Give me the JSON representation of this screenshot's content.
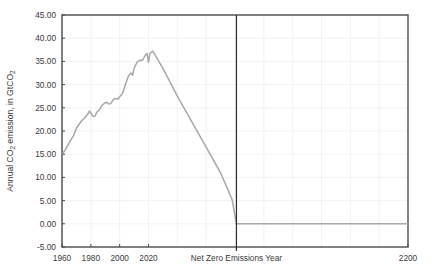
{
  "chart_data": {
    "type": "line",
    "title": "",
    "xlabel": "",
    "ylabel": "Annual CO2 emission, in GtCO2",
    "ylabel_display": "Annual CO₂ emission, in GtCO₂",
    "xlim": [
      1960,
      2200
    ],
    "ylim": [
      -5,
      45
    ],
    "grid": true,
    "legend": "none",
    "y_ticks": [
      -5,
      0,
      5,
      10,
      15,
      20,
      25,
      30,
      35,
      40,
      45
    ],
    "y_tick_labels": [
      "-5.00",
      "0.00",
      "5.00",
      "10.00",
      "15.00",
      "20.00",
      "25.00",
      "30.00",
      "35.00",
      "40.00",
      "45.00"
    ],
    "x_ticks": [
      1960,
      1980,
      2000,
      2020,
      2120,
      2200
    ],
    "x_tick_labels": [
      "1960",
      "1980",
      "2000",
      "2020",
      "Net Zero Emissions Year",
      "2200"
    ],
    "x_gridlines": [
      1980,
      2000,
      2020,
      2040,
      2060,
      2080,
      2100,
      2120,
      2140,
      2160,
      2180
    ],
    "annotations": [
      {
        "name": "net-zero-emissions-year-line",
        "type": "vline",
        "x": 2081,
        "label": "Net Zero Emissions Year"
      }
    ],
    "series": [
      {
        "name": "Annual CO2 emission",
        "color": "#a8a8a8",
        "x": [
          1960,
          1962,
          1964,
          1966,
          1968,
          1970,
          1972,
          1974,
          1976,
          1978,
          1979,
          1980,
          1981,
          1982,
          1983,
          1984,
          1986,
          1988,
          1990,
          1991,
          1992,
          1993,
          1994,
          1996,
          1998,
          1999,
          2000,
          2002,
          2004,
          2006,
          2008,
          2009,
          2010,
          2012,
          2014,
          2015,
          2016,
          2017,
          2018,
          2019,
          2020,
          2021,
          2022,
          2023,
          2030,
          2040,
          2050,
          2060,
          2070,
          2078,
          2081,
          2090,
          2120,
          2160,
          2200
        ],
        "y": [
          15.0,
          15.8,
          16.9,
          18.0,
          19.0,
          20.6,
          21.5,
          22.3,
          22.9,
          23.7,
          24.3,
          23.9,
          23.3,
          23.1,
          23.2,
          24.0,
          24.6,
          25.6,
          26.1,
          26.2,
          25.9,
          25.8,
          26.0,
          26.9,
          27.0,
          26.9,
          27.4,
          28.1,
          30.0,
          31.8,
          32.5,
          32.0,
          33.5,
          34.8,
          35.3,
          35.2,
          35.3,
          35.9,
          36.4,
          36.7,
          34.8,
          36.7,
          37.0,
          37.2,
          33.5,
          27.5,
          22.0,
          16.5,
          11.0,
          5.2,
          0.0,
          0.0,
          0.0,
          0.0,
          0.0
        ]
      }
    ]
  },
  "plot_geometry": {
    "left": 62,
    "right": 408,
    "top": 15,
    "bottom": 247
  }
}
